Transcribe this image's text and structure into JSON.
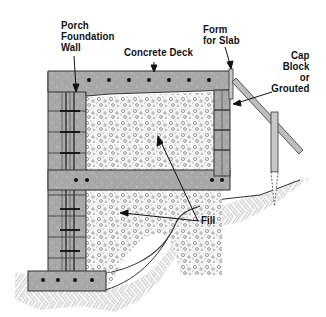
{
  "diagram": {
    "type": "cross-section",
    "labels": {
      "porch_foundation_wall": [
        "Porch",
        "Foundation",
        "Wall"
      ],
      "concrete_deck": "Concrete Deck",
      "form_for_slab": [
        "Form",
        "for Slab"
      ],
      "cap_block": [
        "Cap",
        "Block",
        "or",
        "Grouted"
      ],
      "fill": "Fill"
    },
    "colors": {
      "concrete": "#a9a9a9",
      "block": "#b0b0b0",
      "fill_bg": "#f2f2f2",
      "earth_line": "#555555",
      "ink": "#111111",
      "rebar": "#111111"
    }
  }
}
